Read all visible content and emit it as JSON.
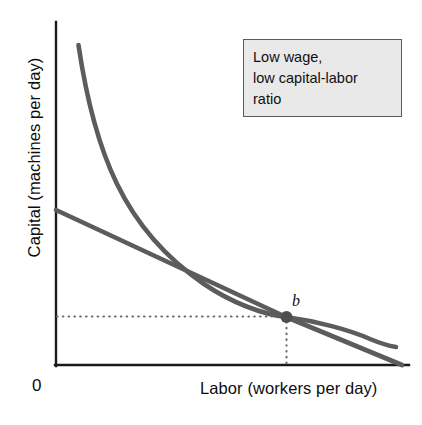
{
  "figure": {
    "background_color": "#ffffff",
    "origin_label": "0"
  },
  "callout": {
    "name": "low-wage-annotation",
    "background_color": "#e9e9e9",
    "border_color": "#5a5a5a",
    "lines": [
      "Low wage,",
      "low capital-labor",
      "ratio"
    ]
  },
  "chart_data": {
    "type": "line",
    "title": "",
    "subtitle": "",
    "xlabel": "Labor (workers per day)",
    "ylabel": "Capital (machines per day)",
    "xlim": [
      0,
      100
    ],
    "ylim": [
      0,
      100
    ],
    "grid": false,
    "legend_position": "none",
    "axis_ticks": [],
    "tick_labels": {
      "x": [],
      "y": []
    },
    "curve_color": "#5c5c5c",
    "axis_color": "#1a1a1a",
    "guide_color": "#6b6b6b",
    "series": [
      {
        "name": "isoquant",
        "label": "",
        "type": "convex-curve",
        "color": "#5c5c5c",
        "linewidth": 4.6,
        "points": [
          [
            7.0,
            94.0
          ],
          [
            8.0,
            86.0
          ],
          [
            9.5,
            77.0
          ],
          [
            11.5,
            68.0
          ],
          [
            14.0,
            59.5
          ],
          [
            17.0,
            51.5
          ],
          [
            20.5,
            44.5
          ],
          [
            25.0,
            37.5
          ],
          [
            30.0,
            31.5
          ],
          [
            36.0,
            26.0
          ],
          [
            43.0,
            21.5
          ],
          [
            50.0,
            18.5
          ],
          [
            56.5,
            16.5
          ],
          [
            63.0,
            15.0
          ],
          [
            70.0,
            13.8
          ],
          [
            78.0,
            12.8
          ],
          [
            86.0,
            12.0
          ],
          [
            92.0,
            11.6
          ],
          [
            96.5,
            11.4
          ]
        ]
      },
      {
        "name": "isocost",
        "label": "",
        "type": "straight-line",
        "color": "#5c5c5c",
        "linewidth": 4.6,
        "points": [
          [
            0.0,
            45.5
          ],
          [
            25.0,
            33.5
          ],
          [
            50.0,
            22.0
          ],
          [
            65.5,
            14.8
          ],
          [
            80.0,
            8.0
          ],
          [
            98.0,
            0.0
          ]
        ]
      }
    ],
    "annotations": [
      {
        "name": "tangency-point-b",
        "label": "b",
        "label_style": "italic",
        "x": 65.5,
        "y": 14.8,
        "marker": "filled-circle",
        "marker_color": "#4e4e4e",
        "marker_radius": 6
      },
      {
        "name": "horizontal-guide-line",
        "style": "dotted",
        "from": [
          0,
          14.8
        ],
        "to": [
          65.5,
          14.8
        ]
      },
      {
        "name": "vertical-guide-line",
        "style": "dotted",
        "from": [
          65.5,
          14.8
        ],
        "to": [
          65.5,
          0
        ]
      }
    ]
  }
}
